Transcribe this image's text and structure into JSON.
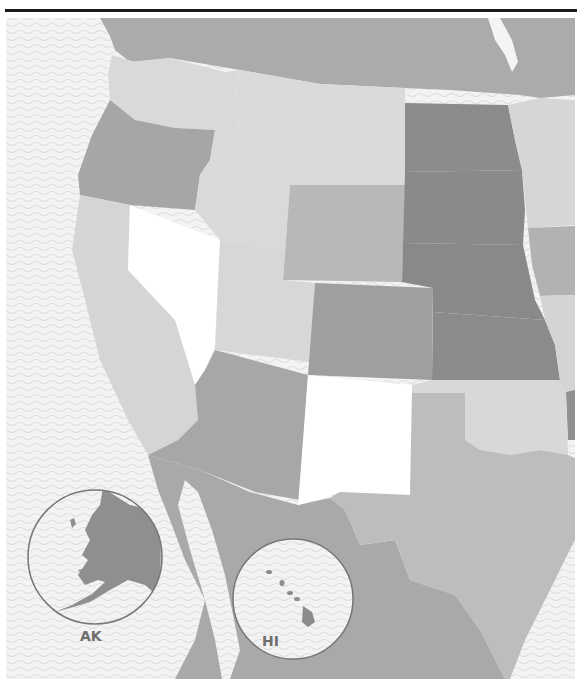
{
  "page": {
    "header_text_cut": "",
    "has_top_rule": true
  },
  "map": {
    "type": "choropleth",
    "region": "Western United States",
    "colors": {
      "ocean": "#f2f2f2",
      "wave": "#e2e2e2",
      "canada": "#ababab",
      "mexico": "#a9a9a9",
      "white_class": "#ffffff",
      "light_class": "#d9d9d9",
      "mid_light_class": "#bdbdbd",
      "mid_class": "#a6a6a6",
      "dark_class": "#8c8c8c",
      "inset_border": "#777777"
    },
    "states": [
      {
        "code": "WA",
        "shade": "light"
      },
      {
        "code": "OR",
        "shade": "mid"
      },
      {
        "code": "CA",
        "shade": "light"
      },
      {
        "code": "NV",
        "shade": "white"
      },
      {
        "code": "ID",
        "shade": "light"
      },
      {
        "code": "MT",
        "shade": "light"
      },
      {
        "code": "WY",
        "shade": "mid_light"
      },
      {
        "code": "UT",
        "shade": "light"
      },
      {
        "code": "CO",
        "shade": "mid"
      },
      {
        "code": "AZ",
        "shade": "mid"
      },
      {
        "code": "NM",
        "shade": "white"
      },
      {
        "code": "ND",
        "shade": "dark"
      },
      {
        "code": "SD",
        "shade": "dark"
      },
      {
        "code": "NE",
        "shade": "dark"
      },
      {
        "code": "KS",
        "shade": "dark"
      },
      {
        "code": "OK",
        "shade": "light"
      },
      {
        "code": "TX",
        "shade": "mid_light"
      },
      {
        "code": "MN",
        "shade": "light"
      },
      {
        "code": "IA",
        "shade": "mid"
      },
      {
        "code": "MO",
        "shade": "light"
      },
      {
        "code": "AK",
        "shade": "dark"
      },
      {
        "code": "HI",
        "shade": "dark"
      }
    ],
    "insets": [
      {
        "id": "alaska",
        "label": "AK"
      },
      {
        "id": "hawaii",
        "label": "HI"
      }
    ]
  }
}
